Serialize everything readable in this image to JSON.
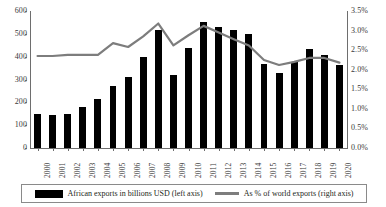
{
  "chart_data": {
    "type": "bar",
    "title": "",
    "subtitle": "",
    "xlabel": "",
    "ylabel": "",
    "categories": [
      "2000",
      "2001",
      "2002",
      "2003",
      "2004",
      "2005",
      "2006",
      "2007",
      "2008",
      "2009",
      "2010",
      "2011",
      "2012",
      "2013",
      "2014",
      "2015",
      "2016",
      "2017",
      "2018",
      "2019",
      "2020"
    ],
    "series": [
      {
        "name": "African exports in billions USD (left axis)",
        "type": "bar",
        "axis": "left",
        "color": "#000000",
        "values": [
          148,
          143,
          150,
          180,
          213,
          273,
          310,
          397,
          515,
          321,
          438,
          553,
          530,
          516,
          498,
          368,
          327,
          375,
          435,
          408,
          364
        ]
      },
      {
        "name": "As % of world exports (right axis)",
        "type": "line",
        "axis": "right",
        "color": "#7d7d7d",
        "values": [
          2.35,
          2.35,
          2.38,
          2.38,
          2.38,
          2.68,
          2.58,
          2.85,
          3.18,
          2.62,
          2.88,
          3.12,
          2.95,
          2.78,
          2.62,
          2.25,
          2.12,
          2.2,
          2.3,
          2.3,
          2.18
        ]
      }
    ],
    "ylim": [
      0,
      600
    ],
    "y2lim": [
      0,
      3.5
    ],
    "yticks": [
      0,
      100,
      200,
      300,
      400,
      500,
      600
    ],
    "yticklabels": [
      "0",
      "100",
      "200",
      "300",
      "400",
      "500",
      "600"
    ],
    "y2ticks": [
      0.0,
      0.5,
      1.0,
      1.5,
      2.0,
      2.5,
      3.0,
      3.5
    ],
    "y2ticklabels": [
      "0.0%",
      "0.5%",
      "1.0%",
      "1.5%",
      "2.0%",
      "2.5%",
      "3.0%",
      "3.5%"
    ],
    "grid": false,
    "legend_position": "bottom"
  },
  "legend": {
    "entries": [
      {
        "label": "African exports in billions USD (left axis)",
        "marker": "bar-swatch"
      },
      {
        "label": "As % of world exports (right axis)",
        "marker": "line-swatch"
      }
    ]
  }
}
